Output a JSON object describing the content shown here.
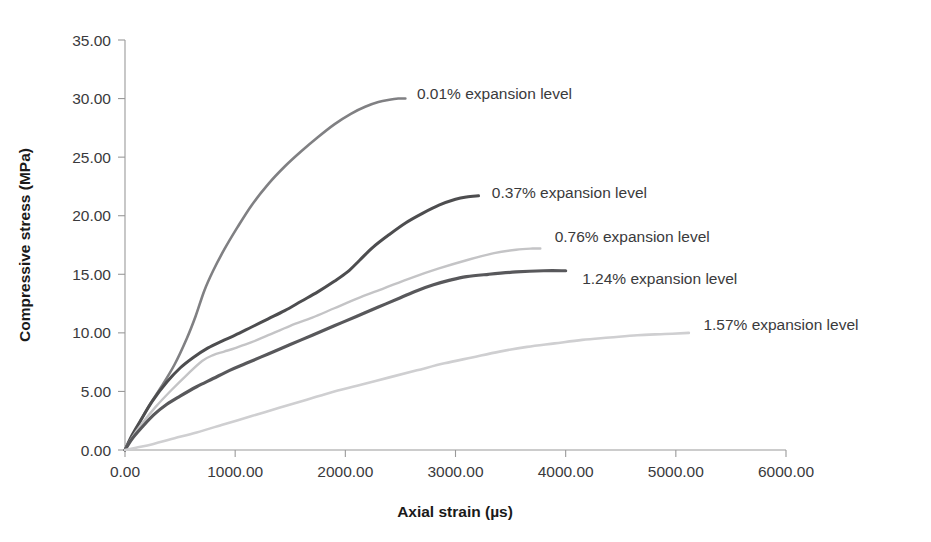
{
  "chart_data": {
    "type": "line",
    "title": "",
    "xlabel": "Axial strain (µs)",
    "ylabel": "Compressive stress (MPa)",
    "xlim": [
      0,
      6000
    ],
    "ylim": [
      0,
      35
    ],
    "grid": false,
    "legend_position": "inline-right-of-curve-ends",
    "xticks": [
      0,
      1000,
      2000,
      3000,
      4000,
      5000,
      6000
    ],
    "yticks": [
      0,
      5,
      10,
      15,
      20,
      25,
      30,
      35
    ],
    "xtick_labels": [
      "0.00",
      "1000.00",
      "2000.00",
      "3000.00",
      "4000.00",
      "5000.00",
      "6000.00"
    ],
    "ytick_labels": [
      "0.00",
      "5.00",
      "10.00",
      "15.00",
      "20.00",
      "25.00",
      "30.00",
      "35.00"
    ],
    "series": [
      {
        "name": "0.01% expansion level",
        "color": "#808083",
        "width": 2.6,
        "label_x": 2650,
        "label_y": 30.4,
        "x": [
          0,
          60,
          130,
          220,
          330,
          450,
          560,
          640,
          720,
          800,
          900,
          1020,
          1150,
          1300,
          1450,
          1600,
          1750,
          1900,
          2050,
          2180,
          2300,
          2400,
          2480,
          2545
        ],
        "y": [
          0,
          1.1,
          2.3,
          3.8,
          5.4,
          7.3,
          9.5,
          11.4,
          13.6,
          15.3,
          17.1,
          19.0,
          20.9,
          22.7,
          24.2,
          25.5,
          26.7,
          27.8,
          28.7,
          29.3,
          29.7,
          29.9,
          30.0,
          30.0
        ]
      },
      {
        "name": "0.37% expansion level",
        "color": "#4d4d4f",
        "width": 3.0,
        "label_x": 3330,
        "label_y": 22.0,
        "x": [
          0,
          60,
          140,
          250,
          380,
          500,
          620,
          750,
          880,
          1000,
          1150,
          1300,
          1450,
          1600,
          1750,
          1900,
          2020,
          2130,
          2250,
          2400,
          2550,
          2700,
          2850,
          3000,
          3100,
          3209
        ],
        "y": [
          0,
          1.2,
          2.5,
          4.2,
          5.8,
          7.0,
          7.9,
          8.7,
          9.3,
          9.8,
          10.5,
          11.2,
          11.9,
          12.7,
          13.5,
          14.4,
          15.2,
          16.2,
          17.3,
          18.4,
          19.4,
          20.2,
          20.9,
          21.4,
          21.6,
          21.7
        ]
      },
      {
        "name": "0.76% expansion level",
        "color": "#c4c4c6",
        "width": 2.4,
        "label_x": 3900,
        "label_y": 18.2,
        "x": [
          0,
          60,
          150,
          280,
          420,
          560,
          700,
          800,
          900,
          1000,
          1150,
          1300,
          1500,
          1700,
          1900,
          2100,
          2350,
          2600,
          2850,
          3100,
          3350,
          3550,
          3700,
          3770
        ],
        "y": [
          0,
          1.0,
          2.2,
          3.7,
          5.1,
          6.4,
          7.6,
          8.1,
          8.4,
          8.7,
          9.2,
          9.8,
          10.6,
          11.3,
          12.1,
          12.9,
          13.8,
          14.7,
          15.5,
          16.2,
          16.8,
          17.1,
          17.2,
          17.2
        ]
      },
      {
        "name": "1.24% expansion level",
        "color": "#58585b",
        "width": 3.2,
        "label_x": 4150,
        "label_y": 14.6,
        "x": [
          0,
          60,
          150,
          260,
          380,
          500,
          650,
          800,
          950,
          1100,
          1300,
          1500,
          1700,
          1900,
          2100,
          2300,
          2500,
          2650,
          2800,
          2950,
          3100,
          3300,
          3550,
          3800,
          4000
        ],
        "y": [
          0,
          0.9,
          1.9,
          3.0,
          3.9,
          4.6,
          5.4,
          6.1,
          6.8,
          7.4,
          8.2,
          9.0,
          9.8,
          10.6,
          11.4,
          12.2,
          13.0,
          13.6,
          14.1,
          14.5,
          14.8,
          15.0,
          15.2,
          15.3,
          15.3
        ]
      },
      {
        "name": "1.57% expansion level",
        "color": "#cfcfd1",
        "width": 2.6,
        "label_x": 5250,
        "label_y": 10.7,
        "x": [
          0,
          100,
          250,
          450,
          650,
          900,
          1150,
          1400,
          1650,
          1900,
          2150,
          2400,
          2650,
          2900,
          3150,
          3400,
          3650,
          3900,
          4150,
          4400,
          4650,
          4900,
          5118
        ],
        "y": [
          0,
          0.2,
          0.5,
          1.0,
          1.5,
          2.2,
          2.9,
          3.6,
          4.3,
          5.0,
          5.6,
          6.2,
          6.8,
          7.4,
          7.9,
          8.4,
          8.8,
          9.1,
          9.4,
          9.6,
          9.8,
          9.9,
          10.0
        ]
      }
    ]
  },
  "axes": {
    "x_title": "Axial strain (µs)",
    "y_title": "Compressive stress (MPa)"
  }
}
